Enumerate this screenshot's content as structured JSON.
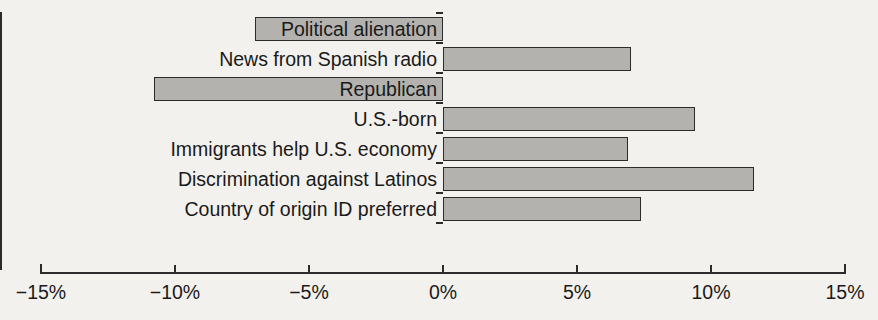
{
  "chart_data": {
    "type": "bar",
    "orientation": "horizontal",
    "title": "",
    "subtitle": "",
    "xlabel": "",
    "ylabel": "",
    "xlim": [
      -15,
      15
    ],
    "xticks": [
      -15,
      -10,
      -5,
      0,
      5,
      10,
      15
    ],
    "xtick_labels": [
      "−15%",
      "−10%",
      "−5%",
      "0%",
      "5%",
      "10%",
      "15%"
    ],
    "grid": false,
    "legend": null,
    "categories": [
      "Political alienation",
      "News from Spanish radio",
      "Republican",
      "U.S.-born",
      "Immigrants help U.S. economy",
      "Discrimination against Latinos",
      "Country of origin ID preferred"
    ],
    "values": [
      -7.0,
      7.0,
      -10.8,
      9.4,
      6.9,
      11.6,
      7.4
    ],
    "bar_fill_color": "#b4b2ae",
    "bar_edge_color": "#2b2b2b",
    "background_color": "#f3f1ed",
    "text_color": "#1a1a1a"
  },
  "chart": {
    "bars": [
      {
        "label": "Political alienation",
        "value": -7.0
      },
      {
        "label": "News from Spanish radio",
        "value": 7.0
      },
      {
        "label": "Republican",
        "value": -10.8
      },
      {
        "label": "U.S.-born",
        "value": 9.4
      },
      {
        "label": "Immigrants help U.S. economy",
        "value": 6.9
      },
      {
        "label": "Discrimination against Latinos",
        "value": 11.6
      },
      {
        "label": "Country of origin ID preferred",
        "value": 7.4
      }
    ],
    "axis": {
      "ticks": [
        {
          "label": "−15%",
          "value": -15
        },
        {
          "label": "−10%",
          "value": -10
        },
        {
          "label": "−5%",
          "value": -5
        },
        {
          "label": "0%",
          "value": 0
        },
        {
          "label": "5%",
          "value": 5
        },
        {
          "label": "10%",
          "value": 10
        },
        {
          "label": "15%",
          "value": 15
        }
      ]
    }
  }
}
